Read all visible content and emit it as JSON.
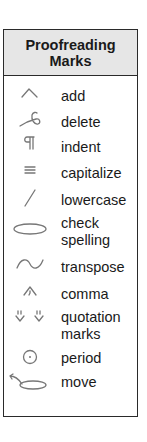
{
  "title": "Proofreading Marks",
  "marks": [
    {
      "label": "add",
      "icon": "caret-icon"
    },
    {
      "label": "delete",
      "icon": "delete-loop-icon"
    },
    {
      "label": "indent",
      "icon": "pilcrow-icon"
    },
    {
      "label": "capitalize",
      "icon": "triple-underline-icon"
    },
    {
      "label": "lowercase",
      "icon": "slash-icon"
    },
    {
      "label": "check spelling",
      "icon": "ellipse-icon"
    },
    {
      "label": "transpose",
      "icon": "tilde-icon"
    },
    {
      "label": "comma",
      "icon": "caret-comma-icon"
    },
    {
      "label": "quotation marks",
      "icon": "quotation-carets-icon"
    },
    {
      "label": "period",
      "icon": "circled-dot-icon"
    },
    {
      "label": "move",
      "icon": "move-arrow-icon"
    }
  ]
}
